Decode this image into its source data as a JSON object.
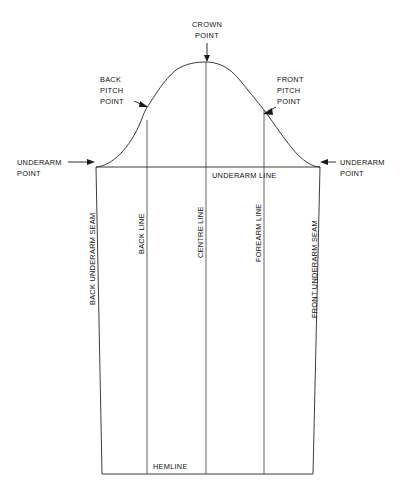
{
  "diagram": {
    "type": "line-drawing",
    "colors": {
      "background": "#ffffff",
      "line": "#262626",
      "guide": "#3a3a3a",
      "text": "#111111"
    },
    "labels": {
      "crown_point": {
        "line1": "CROWN",
        "line2": "POINT"
      },
      "back_pitch_point": {
        "line1": "BACK",
        "line2": "PITCH",
        "line3": "POINT"
      },
      "front_pitch_point": {
        "line1": "FRONT",
        "line2": "PITCH",
        "line3": "POINT"
      },
      "underarm_point_left": {
        "line1": "UNDERARM",
        "line2": "POINT"
      },
      "underarm_point_right": {
        "line1": "UNDERARM",
        "line2": "POINT"
      },
      "underarm_line": "UNDERARM LINE",
      "back_underarm_seam": "BACK UNDERARM SEAM",
      "back_line": "BACK LINE",
      "centre_line": "CENTRE LINE",
      "forearm_line": "FOREARM  LINE",
      "front_underarm_seam": "FRONT UNDERARM SEAM",
      "hemline": "HEMLINE"
    },
    "geometry": {
      "crown_point": {
        "x": 206,
        "y": 62
      },
      "back_pitch_point": {
        "x": 148,
        "y": 106
      },
      "front_pitch_point": {
        "x": 264,
        "y": 110
      },
      "underarm_point_left": {
        "x": 96,
        "y": 167
      },
      "underarm_point_right": {
        "x": 320,
        "y": 167
      },
      "hem_left": {
        "x": 102,
        "y": 474
      },
      "hem_right": {
        "x": 313,
        "y": 474
      },
      "back_line_x": 147,
      "centre_line_x": 206,
      "forearm_line_x": 264,
      "underarm_line_y": 167,
      "hemline_y": 474
    }
  }
}
